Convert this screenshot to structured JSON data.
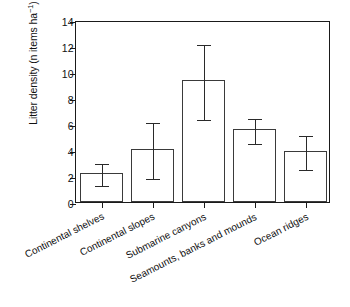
{
  "chart_data": {
    "type": "bar",
    "title": "",
    "xlabel": "",
    "ylabel": "Litter density (n items ha",
    "ylabel_exponent": "−1",
    "ylabel_suffix": ")",
    "categories": [
      "Continental shelves",
      "Continental slopes",
      "Submarine canyons",
      "Seamounts, banks and mounds",
      "Ocean ridges"
    ],
    "values": [
      2.25,
      4.1,
      9.35,
      5.6,
      3.9
    ],
    "error_upper": [
      3.1,
      6.25,
      12.25,
      6.55,
      5.2
    ],
    "error_lower": [
      1.35,
      1.95,
      6.45,
      4.6,
      2.65
    ],
    "ylim": [
      0,
      14
    ],
    "yticks": [
      0,
      2,
      4,
      6,
      8,
      10,
      12,
      14
    ],
    "ytick_labels": [
      "0",
      "2",
      "4",
      "6",
      "8",
      "10",
      "12",
      "14"
    ],
    "grid": false,
    "legend": false,
    "legend_position": "none",
    "bar_facecolor": "#ffffff",
    "bar_edgecolor": "#3a3a3a",
    "error_color": "#2a2a2a",
    "axis_color": "#1a1a1a",
    "background": "#ffffff"
  }
}
